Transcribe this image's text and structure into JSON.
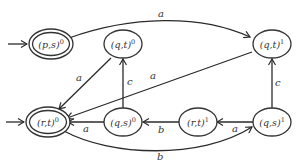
{
  "diagram": {
    "type": "automaton",
    "nodes": [
      {
        "id": "ps0",
        "label": "(p,s)",
        "sup": "0",
        "x": 51,
        "y": 44,
        "accepting": true,
        "initial": true
      },
      {
        "id": "qt0",
        "label": "(q,t)",
        "sup": "0",
        "x": 123,
        "y": 44,
        "accepting": false,
        "initial": false
      },
      {
        "id": "qt1",
        "label": "(q,t)",
        "sup": "1",
        "x": 272,
        "y": 44,
        "accepting": false,
        "initial": false
      },
      {
        "id": "rt0",
        "label": "(r,t)",
        "sup": "0",
        "x": 48,
        "y": 122,
        "accepting": true,
        "initial": true
      },
      {
        "id": "qs0",
        "label": "(q,s)",
        "sup": "0",
        "x": 123,
        "y": 122,
        "accepting": false,
        "initial": false
      },
      {
        "id": "rt1",
        "label": "(r,t)",
        "sup": "1",
        "x": 198,
        "y": 122,
        "accepting": false,
        "initial": false
      },
      {
        "id": "qs1",
        "label": "(q,s)",
        "sup": "1",
        "x": 272,
        "y": 122,
        "accepting": false,
        "initial": false
      }
    ],
    "edges": [
      {
        "from": "ps0",
        "to": "qt1",
        "label": "a"
      },
      {
        "from": "qt0",
        "to": "rt0",
        "label": "a"
      },
      {
        "from": "qs0",
        "to": "qt0",
        "label": "c"
      },
      {
        "from": "qt1",
        "to": "rt0",
        "label": "a"
      },
      {
        "from": "qs0",
        "to": "rt0",
        "label": "a"
      },
      {
        "from": "rt1",
        "to": "qs0",
        "label": "b"
      },
      {
        "from": "qs1",
        "to": "rt1",
        "label": "a"
      },
      {
        "from": "qs1",
        "to": "qt1",
        "label": "c"
      },
      {
        "from": "rt0",
        "to": "qs1",
        "label": "b"
      }
    ]
  }
}
